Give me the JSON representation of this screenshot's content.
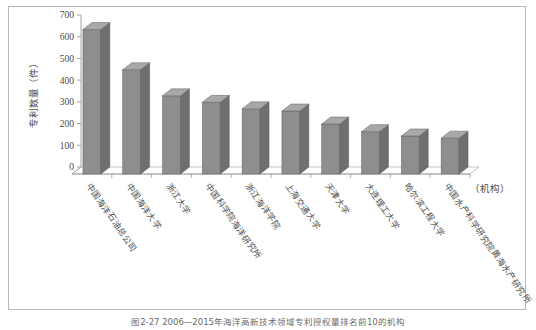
{
  "figure": {
    "caption": "图2-27  2006—2015年海洋高新技术领域专利授权量排名前10的机构"
  },
  "chart_data": {
    "type": "bar",
    "title": "",
    "xlabel": "（机构）",
    "ylabel": "专利数量（件）",
    "ylim": [
      0,
      700
    ],
    "ytick_step": 100,
    "yticks": [
      0,
      100,
      200,
      300,
      400,
      500,
      600,
      700
    ],
    "grid": false,
    "legend": "none",
    "style": "3d-column",
    "bar_color": "#8e8e8e",
    "bar_top_color": "#a8a8a8",
    "bar_side_color": "#6f6f6f",
    "categories": [
      "中国海洋石油总公司",
      "中国海洋大学",
      "浙江大学",
      "中国科学院海洋研究所",
      "浙江海洋学院",
      "上海交通大学",
      "天津大学",
      "大连理工大学",
      "哈尔滨工程大学",
      "中国水产科学研究院黄海水产研究所"
    ],
    "values": [
      665,
      480,
      360,
      330,
      300,
      290,
      230,
      195,
      175,
      165
    ]
  }
}
